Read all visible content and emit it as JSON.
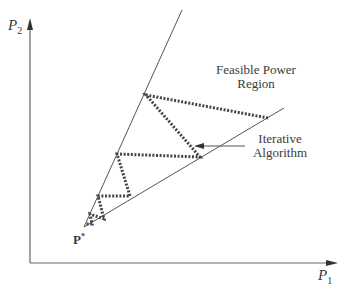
{
  "axes": {
    "y_label": "P",
    "y_sub": "2",
    "x_label": "P",
    "x_sub": "1"
  },
  "region_label": {
    "line1": "Feasible Power",
    "line2": "Region"
  },
  "algorithm_label": {
    "line1": "Iterative",
    "line2": "Algorithm"
  },
  "point_label": {
    "text": "P",
    "sup": "*"
  },
  "colors": {
    "line": "#555555",
    "dots": "#444444",
    "text": "#3a3a3a"
  }
}
